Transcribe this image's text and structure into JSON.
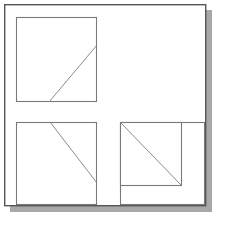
{
  "figure": {
    "title": "Geometric diagram of three squares with diagonal lines",
    "canvas": {
      "width": 225,
      "height": 231,
      "background": "#ffffff"
    },
    "colors": {
      "outline": "#555555",
      "square_stroke": "#7a7a7a",
      "diagonal_stroke": "#8a8a8a",
      "shadow": "#a8a8a8",
      "fill": "#ffffff"
    },
    "stroke_widths": {
      "outer_frame": 1.4,
      "square": 1.1,
      "diagonal": 1.0
    },
    "outer_frame": {
      "label": "outer frame",
      "x": 4,
      "y": 4,
      "width": 202,
      "height": 202
    },
    "drop_shadow": {
      "label": "drop shadow",
      "offset_x": 6,
      "offset_y": 6
    },
    "shapes": [
      {
        "name": "top-left-square",
        "label": "Square 1 (top left)",
        "x": 16,
        "y": 17,
        "width": 81,
        "height": 85,
        "diagonal": {
          "label": "ascending diagonal",
          "x1": 49,
          "y1": 102,
          "x2": 97,
          "y2": 45,
          "direction": "ascending"
        }
      },
      {
        "name": "bottom-left-square",
        "label": "Square 2 (bottom left)",
        "x": 16,
        "y": 122,
        "width": 81,
        "height": 83,
        "diagonal": {
          "label": "descending diagonal",
          "x1": 50,
          "y1": 122,
          "x2": 97,
          "y2": 183,
          "direction": "descending"
        }
      },
      {
        "name": "bottom-right-outer-square",
        "label": "Square 3 outer (bottom right)",
        "x": 120,
        "y": 122,
        "width": 85,
        "height": 83,
        "diagonal": null
      },
      {
        "name": "bottom-right-inner-square",
        "label": "Square 3 inner (bottom right)",
        "x": 120,
        "y": 122,
        "width": 62,
        "height": 64,
        "diagonal": {
          "label": "corner-to-corner descending diagonal",
          "x1": 120,
          "y1": 122,
          "x2": 182,
          "y2": 186,
          "direction": "descending"
        }
      }
    ]
  }
}
